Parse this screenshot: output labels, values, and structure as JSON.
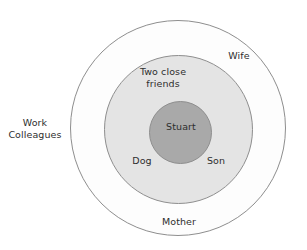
{
  "diagram": {
    "type": "concentric-circles-social-network",
    "title": "",
    "background_color": "#ffffff",
    "rings": [
      {
        "id": "outer",
        "name": "outer-ring",
        "fill_color": "#fdfdfd",
        "stroke_color": "#8e8e8e",
        "center": [
          178,
          128
        ],
        "radius": 108
      },
      {
        "id": "middle",
        "name": "middle-ring",
        "fill_color": "#e4e4e4",
        "stroke_color": "#8e8e8e",
        "center": [
          178,
          129
        ],
        "radius": 74
      },
      {
        "id": "core",
        "name": "core-circle",
        "fill_color": "#a9a9a9",
        "stroke_color": "#8e8e8e",
        "center": [
          180,
          132
        ],
        "radius": 31
      }
    ],
    "labels": {
      "core": "Stuart",
      "middle_top": "Two close\nfriends",
      "middle_bottom_left": "Dog",
      "middle_bottom_right": "Son",
      "outer_top_right": "Wife",
      "outer_bottom": "Mother",
      "outside_left": "Work\nColleagues"
    }
  }
}
